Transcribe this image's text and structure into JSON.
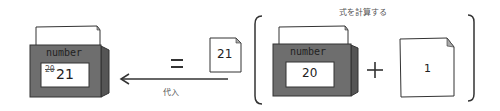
{
  "diagram": {
    "result_variable": {
      "name": "number",
      "old_value": "20",
      "new_value": "21"
    },
    "equals_sign": "=",
    "assigned_value": "21",
    "assign_label": "代入",
    "expression": {
      "label": "式を計算する",
      "variable": {
        "name": "number",
        "value": "20"
      },
      "operator": "+",
      "operand": "1"
    }
  },
  "colors": {
    "box_front": "#6e6e6e",
    "box_side": "#555555",
    "paper": "#ffffff",
    "stroke": "#333333",
    "corner_fold": "#aaaaaa"
  }
}
